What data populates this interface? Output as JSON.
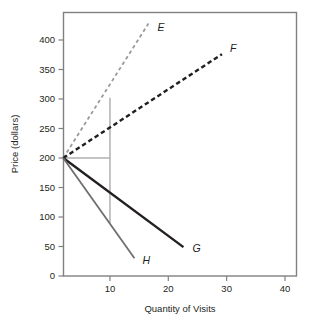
{
  "chart_data": {
    "type": "line",
    "title": "",
    "xlabel": "Quantity of Visits",
    "ylabel": "Price (dollars)",
    "xlim": [
      0,
      43
    ],
    "ylim": [
      0,
      430
    ],
    "xticks": [
      10,
      20,
      30,
      40
    ],
    "xtick_labels": [
      "10",
      "20",
      "30",
      "40"
    ],
    "yticks": [
      0,
      50,
      100,
      150,
      200,
      250,
      300,
      350,
      400
    ],
    "ytick_labels": [
      "0",
      "50",
      "100",
      "150",
      "200",
      "250",
      "300",
      "350",
      "400"
    ],
    "grid": false,
    "legend": "inline-endpoint-labels",
    "origin_point": {
      "x": 2,
      "y": 200
    },
    "series": [
      {
        "name": "E",
        "label": "E",
        "style": "dashed",
        "color": "#9a9a9a",
        "width": 1.8,
        "points": [
          [
            2,
            200
          ],
          [
            16.6,
            428
          ]
        ]
      },
      {
        "name": "F",
        "label": "F",
        "style": "dashed",
        "color": "#231f20",
        "width": 2.4,
        "points": [
          [
            2,
            200
          ],
          [
            29.2,
            376
          ]
        ]
      },
      {
        "name": "G",
        "label": "G",
        "style": "solid",
        "color": "#231f20",
        "width": 2.4,
        "points": [
          [
            2,
            200
          ],
          [
            22.6,
            49
          ]
        ]
      },
      {
        "name": "H",
        "label": "H",
        "style": "solid",
        "color": "#6e6e6e",
        "width": 1.8,
        "points": [
          [
            2,
            200
          ],
          [
            14.2,
            30
          ]
        ]
      }
    ],
    "annotations": [
      {
        "name": "reference-line-horizontal",
        "kind": "segment",
        "color": "#b0b0b0",
        "from": [
          2,
          200
        ],
        "to": [
          10,
          200
        ]
      },
      {
        "name": "reference-line-vertical",
        "kind": "segment",
        "color": "#b0b0b0",
        "from": [
          10,
          302
        ],
        "to": [
          10,
          90
        ]
      }
    ],
    "labels": {
      "E": "E",
      "F": "F",
      "G": "G",
      "H": "H"
    }
  },
  "colors": {
    "frame": "#808080",
    "text": "#231f20",
    "reference": "#b0b0b0",
    "light_series": "#9a9a9a",
    "dark_series": "#231f20",
    "gray_series": "#6e6e6e",
    "background": "#ffffff"
  }
}
